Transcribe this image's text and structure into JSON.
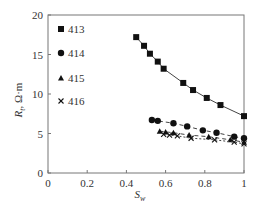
{
  "chart_data": {
    "type": "scatter",
    "title": "",
    "xlabel": "S_w",
    "ylabel": "R_t, Ω·m",
    "xlim": [
      0,
      1
    ],
    "ylim": [
      0,
      20
    ],
    "xticks": [
      0,
      0.2,
      0.4,
      0.6,
      0.8,
      1
    ],
    "xtick_labels": [
      "0",
      "0.2",
      "0.4",
      "0.6",
      "0.8",
      "1"
    ],
    "yticks": [
      0,
      5,
      10,
      15,
      20
    ],
    "ytick_labels": [
      "0",
      "5",
      "10",
      "15",
      "20"
    ],
    "grid": false,
    "legend_position": "upper left",
    "series": [
      {
        "name": "413",
        "marker": "square",
        "line": "solid",
        "x": [
          0.45,
          0.49,
          0.52,
          0.56,
          0.59,
          0.69,
          0.74,
          0.81,
          0.88,
          1.0
        ],
        "y": [
          17.2,
          16.1,
          15.1,
          14.1,
          13.2,
          11.4,
          10.5,
          9.5,
          8.6,
          7.2
        ]
      },
      {
        "name": "414",
        "marker": "circle",
        "line": "dashed",
        "x": [
          0.53,
          0.56,
          0.64,
          0.71,
          0.79,
          0.86,
          0.95,
          1.0
        ],
        "y": [
          6.7,
          6.6,
          6.3,
          5.9,
          5.4,
          5.1,
          4.6,
          4.4
        ]
      },
      {
        "name": "415",
        "marker": "triangle",
        "line": "dashed",
        "x": [
          0.57,
          0.6,
          0.64,
          0.72,
          0.82,
          0.93,
          1.0
        ],
        "y": [
          5.3,
          5.2,
          5.1,
          4.8,
          4.6,
          4.2,
          3.9
        ]
      },
      {
        "name": "416",
        "marker": "cross",
        "line": "dotted",
        "x": [
          0.59,
          0.62,
          0.66,
          0.73,
          0.85,
          0.95,
          1.0
        ],
        "y": [
          4.9,
          4.8,
          4.7,
          4.4,
          4.2,
          3.9,
          3.7
        ]
      }
    ]
  },
  "axis": {
    "xlabel_main": "S",
    "xlabel_sub": "w",
    "ylabel_main": "R",
    "ylabel_sub": "t",
    "ylabel_unit": ",  Ω·m"
  },
  "legend": {
    "items": [
      {
        "label": "413",
        "icon": "square-marker-icon"
      },
      {
        "label": "414",
        "icon": "circle-marker-icon"
      },
      {
        "label": "415",
        "icon": "triangle-marker-icon"
      },
      {
        "label": "416",
        "icon": "cross-marker-icon"
      }
    ]
  }
}
